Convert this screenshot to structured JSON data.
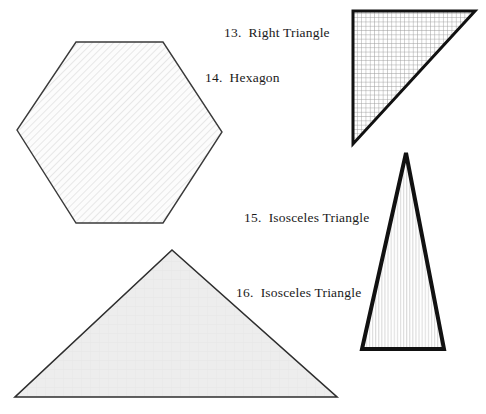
{
  "figure": {
    "background_color": "#ffffff",
    "ink_color": "#1a1a1a",
    "labels": [
      {
        "id": "label-13",
        "number": "13.",
        "text": "Right Triangle",
        "full": "13.  Right Triangle",
        "x": 224,
        "y": 26
      },
      {
        "id": "label-14",
        "number": "14.",
        "text": "Hexagon",
        "full": "14.  Hexagon",
        "x": 205,
        "y": 71
      },
      {
        "id": "label-15",
        "number": "15.",
        "text": "Isosceles Triangle",
        "full": "15.  Isosceles Triangle",
        "x": 244,
        "y": 211
      },
      {
        "id": "label-16",
        "number": "16.",
        "text": "Isosceles Triangle",
        "full": "16.  Isosceles Triangle",
        "x": 236,
        "y": 286
      }
    ],
    "shapes": [
      {
        "id": "hexagon",
        "label_ref": "14.  Hexagon",
        "kind": "hexagon",
        "points": "76,42 163,42 222,132 163,223 76,223 17,130",
        "fill_pattern": "diagonal-hatch-light",
        "fill_color": "#fbfbfb",
        "stroke_color": "#3a3a3a",
        "stroke_width": 1.4
      },
      {
        "id": "right-triangle",
        "label_ref": "13.  Right Triangle",
        "kind": "right-triangle",
        "points": "353,11 475,11 353,144",
        "fill_pattern": "grid-crosshatch",
        "fill_color": "#ffffff",
        "stroke_color": "#111111",
        "stroke_width": 3
      },
      {
        "id": "isosceles-triangle-narrow",
        "label_ref": "15.  Isosceles Triangle",
        "kind": "isosceles-triangle",
        "points": "406,153 444,349 362,349",
        "fill_pattern": "vertical-lines",
        "fill_color": "#ffffff",
        "stroke_color": "#111111",
        "stroke_width": 4
      },
      {
        "id": "isosceles-triangle-wide",
        "label_ref": "16.  Isosceles Triangle",
        "kind": "isosceles-triangle",
        "points": "172,250 337,397 15,397",
        "fill_pattern": "solid-light-gray-texture",
        "fill_color": "#ededed",
        "stroke_color": "#2e2e2e",
        "stroke_width": 1.6
      }
    ]
  }
}
